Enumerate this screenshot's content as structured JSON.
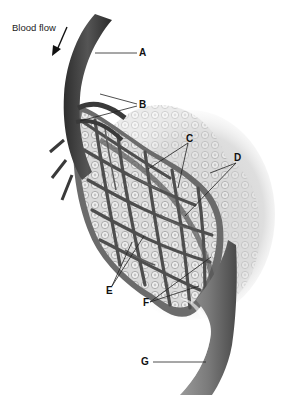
{
  "diagram": {
    "flow_label": "Blood flow",
    "labels": [
      {
        "letter": "A",
        "x": 141,
        "y": 52
      },
      {
        "letter": "B",
        "x": 141,
        "y": 103
      },
      {
        "letter": "C",
        "x": 189,
        "y": 137
      },
      {
        "letter": "D",
        "x": 236,
        "y": 156
      },
      {
        "letter": "E",
        "x": 106,
        "y": 288
      },
      {
        "letter": "F",
        "x": 143,
        "y": 300
      },
      {
        "letter": "G",
        "x": 141,
        "y": 358
      }
    ],
    "colors": {
      "vessel_dark": "#3a3a3a",
      "vessel_mid": "#6a6a6a",
      "vessel_light": "#9a9a9a",
      "cell_fill": "#d8d8d8",
      "cell_outline": "#8a8a8a",
      "tissue": "#e4e4e4",
      "background": "#ffffff"
    }
  }
}
